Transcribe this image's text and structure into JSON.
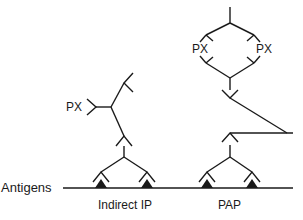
{
  "diagram": {
    "labels": {
      "antigens": "Antigens",
      "px_indirect": "PX",
      "px_pap_left": "PX",
      "px_pap_right": "PX",
      "method_indirect": "Indirect IP",
      "method_pap": "PAP"
    },
    "caption_partial": "Figure 6.1 ... Immunoperoxidase ...",
    "colors": {
      "ink": "#1a1a1a",
      "background": "#ffffff"
    }
  }
}
